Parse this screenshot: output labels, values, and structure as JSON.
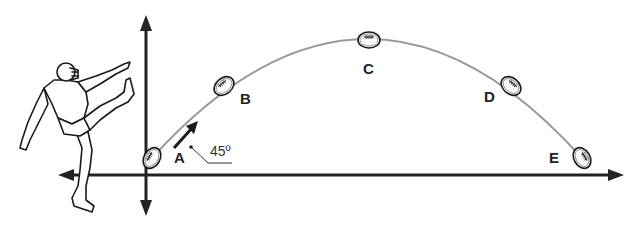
{
  "diagram": {
    "title": "",
    "colors": {
      "axis": "#222222",
      "trajectory": "#9a9a9a",
      "ink": "#1a1a1a"
    },
    "axes": {
      "horizontal": {
        "direction": "bidirectional"
      },
      "vertical": {
        "direction": "bidirectional"
      }
    },
    "points": [
      {
        "id": "A",
        "label": "A"
      },
      {
        "id": "B",
        "label": "B"
      },
      {
        "id": "C",
        "label": "C"
      },
      {
        "id": "D",
        "label": "D"
      },
      {
        "id": "E",
        "label": "E"
      }
    ],
    "launch_angle": {
      "label": "45º"
    },
    "figures": {
      "kicker": "football-kicker",
      "ball": "football"
    }
  }
}
